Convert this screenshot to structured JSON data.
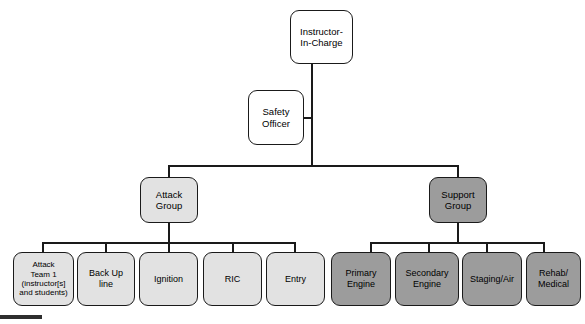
{
  "diagram": {
    "type": "organizational-chart",
    "colors": {
      "line": "#1a1a1a",
      "fill_white": "#ffffff",
      "fill_light_gray": "#e2e2e2",
      "fill_dark_gray": "#9c9c9c",
      "background": "#ffffff",
      "page_marker": "#2e2e2e"
    },
    "levels": [
      {
        "level": 1,
        "nodes": [
          {
            "id": "instructor-in-charge",
            "label": "Instructor-\nIn-Charge",
            "fill": "white"
          }
        ]
      },
      {
        "level": 2,
        "nodes": [
          {
            "id": "safety-officer",
            "label": "Safety\nOfficer",
            "fill": "white"
          }
        ]
      },
      {
        "level": 3,
        "nodes": [
          {
            "id": "attack-group",
            "label": "Attack\nGroup",
            "fill": "light"
          },
          {
            "id": "support-group",
            "label": "Support\nGroup",
            "fill": "dark"
          }
        ]
      },
      {
        "level": 4,
        "nodes": [
          {
            "id": "attack-team-1",
            "label": "Attack\nTeam 1\n(instructor[s]\nand students)",
            "fill": "light",
            "parent": "attack-group"
          },
          {
            "id": "back-up-line",
            "label": "Back Up\nline",
            "fill": "light",
            "parent": "attack-group"
          },
          {
            "id": "ignition",
            "label": "Ignition",
            "fill": "light",
            "parent": "attack-group"
          },
          {
            "id": "ric",
            "label": "RIC",
            "fill": "light",
            "parent": "attack-group"
          },
          {
            "id": "entry",
            "label": "Entry",
            "fill": "light",
            "parent": "attack-group"
          },
          {
            "id": "primary-engine",
            "label": "Primary\nEngine",
            "fill": "dark",
            "parent": "support-group"
          },
          {
            "id": "secondary-engine",
            "label": "Secondary\nEngine",
            "fill": "dark",
            "parent": "support-group"
          },
          {
            "id": "staging-air",
            "label": "Staging/Air",
            "fill": "dark",
            "parent": "support-group"
          },
          {
            "id": "rehab-medical",
            "label": "Rehab/\nMedical",
            "fill": "dark",
            "parent": "support-group"
          }
        ]
      }
    ],
    "nodes": {
      "instructor_in_charge": "Instructor-\nIn-Charge",
      "safety_officer": "Safety\nOfficer",
      "attack_group": "Attack\nGroup",
      "support_group": "Support\nGroup",
      "attack_team_1": "Attack\nTeam 1\n(instructor[s]\nand students)",
      "back_up_line": "Back Up\nline",
      "ignition": "Ignition",
      "ric": "RIC",
      "entry": "Entry",
      "primary_engine": "Primary\nEngine",
      "secondary_engine": "Secondary\nEngine",
      "staging_air": "Staging/Air",
      "rehab_medical": "Rehab/\nMedical"
    }
  }
}
